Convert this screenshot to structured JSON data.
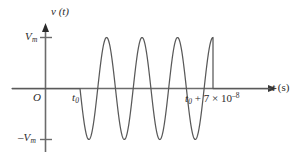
{
  "figure": {
    "background_color": "#ffffff",
    "axis_color": "#6b6b6b",
    "curve_color": "#595959",
    "text_color": "#2b2b2b",
    "labels": {
      "v_axis": "v",
      "v_axis_arg": "(t)",
      "vm": "V",
      "vm_sub": "m",
      "neg_vm_minus": "–",
      "neg_vm": "V",
      "neg_vm_sub": "m",
      "origin": "O",
      "t_start": "t",
      "t_start_sub": "0",
      "t_end_base": "t",
      "t_end_sub": "0",
      "t_end_rest": " + 7 × 10",
      "t_end_exp": "–8",
      "t_axis": "t",
      "t_axis_unit": "(s)"
    }
  },
  "chart_data": {
    "type": "line",
    "title": "",
    "xlabel": "t (s)",
    "ylabel": "v (t)",
    "xlim": [
      0,
      295
    ],
    "ylim": [
      "-Vm",
      "Vm"
    ],
    "grid": false,
    "legend": null,
    "annotations": [
      {
        "text": "t0",
        "x": 80,
        "note": "burst start time on t-axis"
      },
      {
        "text": "t0 + 7 × 10^-8",
        "x": 213,
        "note": "burst end time on t-axis"
      },
      {
        "text": "Vm",
        "y": "positive peak amplitude"
      },
      {
        "text": "-Vm",
        "y": "negative peak amplitude"
      },
      {
        "text": "O",
        "note": "origin"
      }
    ],
    "axes_px": {
      "y_axis_x": 45.5,
      "x_axis_y": 88.5,
      "y_axis_top": 28,
      "y_axis_bottom": 152,
      "x_axis_left": 12,
      "x_axis_right": 270,
      "vm_level_y": 37.5,
      "neg_vm_level_y": 139.5,
      "tick_len": 9
    },
    "series": [
      {
        "name": "burst",
        "description": "sinusoidal burst, zero outside [t0, t0+7e-8], -Vm*sin(2*pi*f*(t-t0)) inside",
        "t_start_px": 80,
        "t_end_px": 213,
        "cycles": 3.75,
        "amplitude": "Vm",
        "phase": "starts descending (negative sine)",
        "samples_px": [
          [
            80,
            88.5
          ],
          [
            82,
            128
          ],
          [
            83.5,
            138
          ],
          [
            86,
            120
          ],
          [
            88.5,
            88.5
          ],
          [
            92,
            55
          ],
          [
            95,
            38
          ],
          [
            99,
            38
          ],
          [
            103,
            55
          ],
          [
            107,
            88.5
          ],
          [
            111,
            122
          ],
          [
            115,
            139
          ],
          [
            119,
            139
          ],
          [
            123,
            122
          ],
          [
            127,
            88.5
          ],
          [
            131,
            55
          ],
          [
            135,
            38
          ],
          [
            139,
            38
          ],
          [
            143,
            55
          ],
          [
            147,
            88.5
          ],
          [
            151,
            122
          ],
          [
            155,
            139
          ],
          [
            159,
            139
          ],
          [
            163,
            122
          ],
          [
            167,
            88.5
          ],
          [
            171,
            55
          ],
          [
            175,
            38
          ],
          [
            179,
            38
          ],
          [
            183,
            55
          ],
          [
            187,
            88.5
          ],
          [
            191,
            122
          ],
          [
            195,
            139
          ],
          [
            199,
            139
          ],
          [
            202,
            122
          ],
          [
            205,
            88.5
          ],
          [
            208,
            55
          ],
          [
            210,
            40
          ],
          [
            212,
            62
          ],
          [
            213,
            88.5
          ],
          [
            270,
            88.5
          ]
        ]
      }
    ]
  }
}
